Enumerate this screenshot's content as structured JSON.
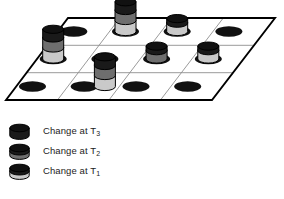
{
  "figure": {
    "title": "",
    "surface": {
      "fill": "#ffffff",
      "border_color": "#000000",
      "grid_line_color": "#8c8c8c",
      "columns": 4,
      "rows": 3,
      "corners": {
        "top_left": [
          68,
          18
        ],
        "top_right": [
          275,
          18
        ],
        "bottom_right": [
          212,
          100
        ],
        "bottom_left": [
          6,
          100
        ]
      }
    },
    "node_marker": {
      "name": "node-ellipse",
      "fill": "#111111",
      "rx": 13.5,
      "ry": 5.2
    },
    "cells": [
      {
        "row": 0,
        "col": 0,
        "node": true,
        "cylinder": null
      },
      {
        "row": 0,
        "col": 1,
        "node": true,
        "cylinder": "T3_T2_T1"
      },
      {
        "row": 0,
        "col": 2,
        "node": true,
        "cylinder": "T3_T1"
      },
      {
        "row": 0,
        "col": 3,
        "node": true,
        "cylinder": null
      },
      {
        "row": 1,
        "col": 0,
        "node": true,
        "cylinder": "T3_T2_T1"
      },
      {
        "row": 1,
        "col": 1,
        "node": true,
        "cylinder": null
      },
      {
        "row": 1,
        "col": 2,
        "node": true,
        "cylinder": "T3_T2"
      },
      {
        "row": 1,
        "col": 3,
        "node": true,
        "cylinder": "T3_T1"
      },
      {
        "row": 2,
        "col": 0,
        "node": true,
        "cylinder": null
      },
      {
        "row": 2,
        "col": 1,
        "node": true,
        "cylinder": "T3_T2_T1"
      },
      {
        "row": 2,
        "col": 2,
        "node": true,
        "cylinder": null
      },
      {
        "row": 2,
        "col": 3,
        "node": true,
        "cylinder": null
      }
    ]
  },
  "bands": {
    "T3": {
      "label": "T3",
      "fill": "#1a1a1a",
      "name": "band-t3-dark"
    },
    "T2": {
      "label": "T2",
      "fill": "#6e6e6e",
      "name": "band-t2-medium"
    },
    "T1": {
      "label": "T1",
      "fill": "#c9c9c9",
      "name": "band-t1-light"
    },
    "top_cap": {
      "fill": "#101010"
    },
    "outline": "#000000"
  },
  "legend": {
    "items": [
      {
        "swatch": "T3",
        "text_prefix": "Change at T",
        "subscript": "3",
        "swatch_name": "legend-swatch-t3"
      },
      {
        "swatch": "T2",
        "text_prefix": "Change at T",
        "subscript": "2",
        "swatch_name": "legend-swatch-t2"
      },
      {
        "swatch": "T1",
        "text_prefix": "Change at T",
        "subscript": "1",
        "swatch_name": "legend-swatch-t1"
      }
    ]
  }
}
